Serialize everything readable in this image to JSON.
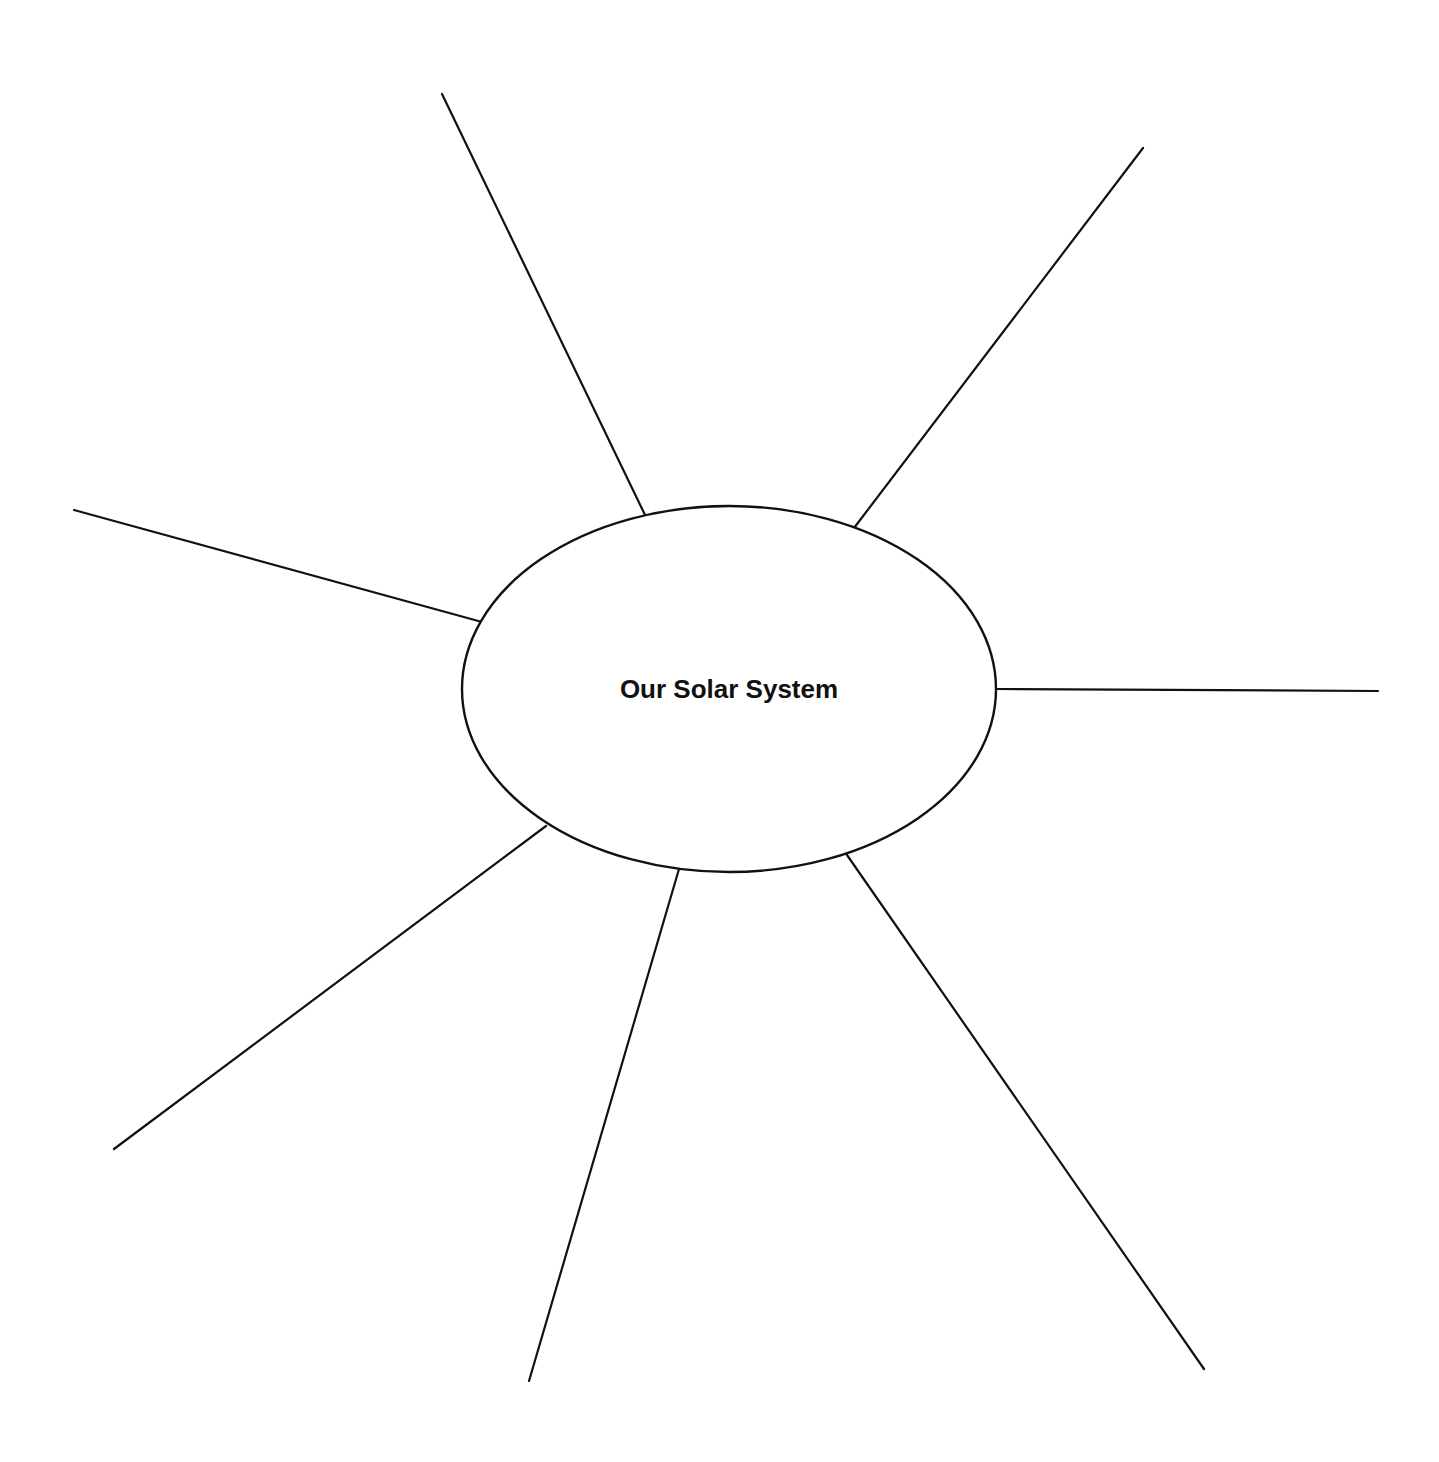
{
  "diagram": {
    "type": "web-organizer",
    "center_label": "Our Solar System",
    "spoke_count": 8,
    "spokes": [
      {
        "id": "spoke-top-left",
        "label": ""
      },
      {
        "id": "spoke-top-right",
        "label": ""
      },
      {
        "id": "spoke-left",
        "label": ""
      },
      {
        "id": "spoke-right",
        "label": ""
      },
      {
        "id": "spoke-bottom-left",
        "label": ""
      },
      {
        "id": "spoke-bottom-center-left",
        "label": ""
      },
      {
        "id": "spoke-bottom-right",
        "label": ""
      },
      {
        "id": "spoke-bottom-far-right",
        "label": ""
      }
    ],
    "line_color": "#111111",
    "background_color": "#ffffff"
  }
}
